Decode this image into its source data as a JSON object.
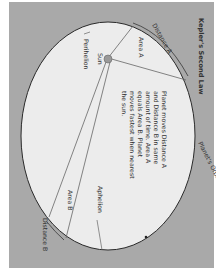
{
  "title": "Kepler's Second Law",
  "labels": {
    "distance_a": "Distance A",
    "distance_b": "Distance B",
    "area_a": "Area A",
    "area_b": "Area B",
    "sun": "Sun",
    "perihelion": "Perihelion",
    "aphelion": "Aphelion",
    "orbit": "Planet's Orbit Around Sun"
  },
  "description_lines": [
    "Planet moves Distance A",
    "and Distance B in same",
    "amount of time. Area A",
    "equals Area B. Planet",
    "moves fastest when nearest",
    "the sun."
  ],
  "colors": {
    "panel": "#a9a9a9",
    "ellipse": "#ececec",
    "line": "#555555"
  }
}
